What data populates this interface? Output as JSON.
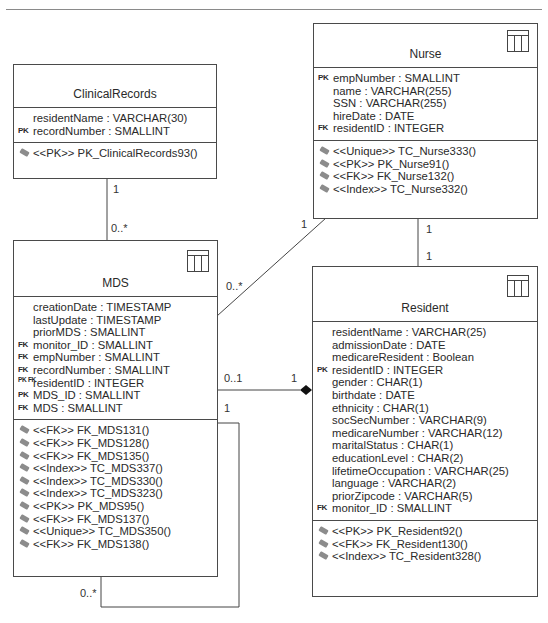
{
  "diagram": {
    "type": "UML class diagram (database schema)",
    "tables": {
      "clinical_records": {
        "name": "ClinicalRecords",
        "attributes": [
          {
            "key": "",
            "text": "residentName : VARCHAR(30)"
          },
          {
            "key": "PK",
            "text": "recordNumber : SMALLINT"
          }
        ],
        "operations": [
          "<<PK>> PK_ClinicalRecords93()"
        ]
      },
      "nurse": {
        "name": "Nurse",
        "attributes": [
          {
            "key": "PK",
            "text": "empNumber : SMALLINT"
          },
          {
            "key": "",
            "text": "name : VARCHAR(255)"
          },
          {
            "key": "",
            "text": "SSN : VARCHAR(255)"
          },
          {
            "key": "",
            "text": "hireDate : DATE"
          },
          {
            "key": "FK",
            "text": "residentID : INTEGER"
          }
        ],
        "operations": [
          "<<Unique>> TC_Nurse333()",
          "<<PK>> PK_Nurse91()",
          "<<FK>> FK_Nurse132()",
          "<<Index>> TC_Nurse332()"
        ]
      },
      "mds": {
        "name": "MDS",
        "attributes": [
          {
            "key": "",
            "text": "creationDate : TIMESTAMP"
          },
          {
            "key": "",
            "text": "lastUpdate : TIMESTAMP"
          },
          {
            "key": "",
            "text": "priorMDS : SMALLINT"
          },
          {
            "key": "FK",
            "text": "monitor_ID : SMALLINT"
          },
          {
            "key": "FK",
            "text": "empNumber : SMALLINT"
          },
          {
            "key": "FK",
            "text": "recordNumber : SMALLINT"
          },
          {
            "key": "PK FK",
            "text": "residentID : INTEGER"
          },
          {
            "key": "PK",
            "text": "MDS_ID : SMALLINT"
          },
          {
            "key": "FK",
            "text": "MDS : SMALLINT"
          }
        ],
        "operations": [
          "<<FK>> FK_MDS131()",
          "<<FK>> FK_MDS128()",
          "<<FK>> FK_MDS135()",
          "<<Index>> TC_MDS337()",
          "<<Index>> TC_MDS330()",
          "<<Index>> TC_MDS323()",
          "<<PK>> PK_MDS95()",
          "<<FK>> FK_MDS137()",
          "<<Unique>> TC_MDS350()",
          "<<FK>> FK_MDS138()"
        ]
      },
      "resident": {
        "name": "Resident",
        "attributes": [
          {
            "key": "",
            "text": "residentName : VARCHAR(25)"
          },
          {
            "key": "",
            "text": "admissionDate : DATE"
          },
          {
            "key": "",
            "text": "medicareResident : Boolean"
          },
          {
            "key": "PK",
            "text": "residentID : INTEGER"
          },
          {
            "key": "",
            "text": "gender : CHAR(1)"
          },
          {
            "key": "",
            "text": "birthdate : DATE"
          },
          {
            "key": "",
            "text": "ethnicity : CHAR(1)"
          },
          {
            "key": "",
            "text": "socSecNumber : VARCHAR(9)"
          },
          {
            "key": "",
            "text": "medicareNumber : VARCHAR(12)"
          },
          {
            "key": "",
            "text": "maritalStatus : CHAR(1)"
          },
          {
            "key": "",
            "text": "educationLevel : CHAR(2)"
          },
          {
            "key": "",
            "text": "lifetimeOccupation : VARCHAR(25)"
          },
          {
            "key": "",
            "text": "language : VARCHAR(2)"
          },
          {
            "key": "",
            "text": "priorZipcode : VARCHAR(5)"
          },
          {
            "key": "FK",
            "text": "monitor_ID : SMALLINT"
          }
        ],
        "operations": [
          "<<PK>> PK_Resident92()",
          "<<FK>> FK_Resident130()",
          "<<Index>> TC_Resident328()"
        ]
      }
    },
    "associations": [
      {
        "from": "ClinicalRecords",
        "to": "MDS",
        "from_mult": "1",
        "to_mult": "0..*"
      },
      {
        "from": "Nurse",
        "to": "MDS",
        "from_mult": "1",
        "to_mult": "0..*"
      },
      {
        "from": "Nurse",
        "to": "Resident",
        "from_mult": "1",
        "to_mult": "1"
      },
      {
        "from": "MDS",
        "to": "Resident",
        "from_mult": "0..1",
        "to_mult": "1",
        "composition": true
      },
      {
        "from": "MDS",
        "to": "MDS",
        "from_mult": "1",
        "to_mult": "0..*",
        "self": true
      }
    ],
    "labels": {
      "cr_one": "1",
      "cr_many": "0..*",
      "nurse_mds_one": "1",
      "nurse_mds_many": "0..*",
      "nurse_res_top": "1",
      "nurse_res_bottom": "1",
      "mds_res_left": "0..1",
      "mds_res_right": "1",
      "self_one": "1",
      "self_many": "0..*"
    }
  }
}
